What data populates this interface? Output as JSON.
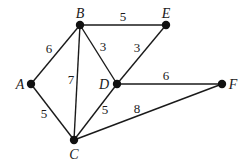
{
  "diagram": {
    "type": "weighted-undirected-graph",
    "nodes": [
      {
        "id": "A",
        "label": "A",
        "x": 31,
        "y": 84,
        "label_x": 20,
        "label_y": 89
      },
      {
        "id": "B",
        "label": "B",
        "x": 80,
        "y": 25,
        "label_x": 80,
        "label_y": 18
      },
      {
        "id": "C",
        "label": "C",
        "x": 74,
        "y": 140,
        "label_x": 74,
        "label_y": 159
      },
      {
        "id": "D",
        "label": "D",
        "x": 117,
        "y": 84,
        "label_x": 104,
        "label_y": 89
      },
      {
        "id": "E",
        "label": "E",
        "x": 166,
        "y": 25,
        "label_x": 166,
        "label_y": 18
      },
      {
        "id": "F",
        "label": "F",
        "x": 222,
        "y": 84,
        "label_x": 233,
        "label_y": 89
      }
    ],
    "edges": [
      {
        "from": "A",
        "to": "B",
        "weight": "6",
        "label_x": 49,
        "label_y": 53
      },
      {
        "from": "A",
        "to": "C",
        "weight": "5",
        "label_x": 44,
        "label_y": 118
      },
      {
        "from": "B",
        "to": "C",
        "weight": "7",
        "label_x": 71,
        "label_y": 84
      },
      {
        "from": "B",
        "to": "D",
        "weight": "3",
        "label_x": 103,
        "label_y": 51
      },
      {
        "from": "B",
        "to": "E",
        "weight": "5",
        "label_x": 123,
        "label_y": 21
      },
      {
        "from": "D",
        "to": "E",
        "weight": "3",
        "label_x": 137,
        "label_y": 52
      },
      {
        "from": "C",
        "to": "D",
        "weight": "5",
        "label_x": 105,
        "label_y": 114
      },
      {
        "from": "D",
        "to": "F",
        "weight": "6",
        "label_x": 166,
        "label_y": 80
      },
      {
        "from": "C",
        "to": "F",
        "weight": "8",
        "label_x": 137,
        "label_y": 113
      }
    ]
  }
}
